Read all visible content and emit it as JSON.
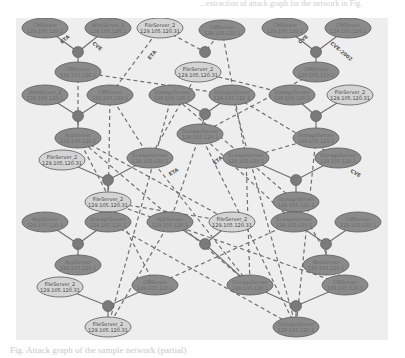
{
  "page": {
    "top_text": "...extraction of attack graph for the network in Fig.",
    "caption": "Fig. Attack graph of the sample network (partial)"
  },
  "colors": {
    "background": "#ffffff",
    "panel": "#eeeeee",
    "dark_node": "#8a8a8a",
    "light_node": "#d4d4d4",
    "junction": "#7a7a7a",
    "edge": "#707070"
  },
  "diagram": {
    "type": "attack-graph",
    "nodes": [
      {
        "id": "n1",
        "kind": "dark",
        "x": 45,
        "y": 28,
        "label": "CMServer",
        "sub": "129.105.120.1"
      },
      {
        "id": "n2",
        "kind": "dark",
        "x": 108,
        "y": 28,
        "label": "WebServer_2",
        "sub": "129.105.120.1"
      },
      {
        "id": "n3",
        "kind": "light",
        "x": 160,
        "y": 28,
        "label": "FileServer_2",
        "sub": "129.105.120.31"
      },
      {
        "id": "n4",
        "kind": "dark",
        "x": 222,
        "y": 30,
        "label": "CMServer",
        "sub": "129.105.120.1"
      },
      {
        "id": "n5",
        "kind": "dark",
        "x": 285,
        "y": 28,
        "label": "CMServer",
        "sub": "129.105.120.1"
      },
      {
        "id": "n6",
        "kind": "dark",
        "x": 348,
        "y": 28,
        "label": "CMServer",
        "sub": "129.105.120.1"
      },
      {
        "id": "n7",
        "kind": "dark",
        "x": 78,
        "y": 72,
        "label": "CMServer",
        "sub": "129.105.120.1"
      },
      {
        "id": "n8",
        "kind": "light",
        "x": 198,
        "y": 72,
        "label": "FileServer_2",
        "sub": "129.105.120.31"
      },
      {
        "id": "n9",
        "kind": "dark",
        "x": 316,
        "y": 72,
        "label": "CMServer",
        "sub": "129.105.120.1"
      },
      {
        "id": "n10",
        "kind": "dark",
        "x": 45,
        "y": 95,
        "label": "WebServer_2",
        "sub": "129.105.120.1"
      },
      {
        "id": "n11",
        "kind": "dark",
        "x": 110,
        "y": 95,
        "label": "CMServer",
        "sub": "129.105.120.1"
      },
      {
        "id": "n12",
        "kind": "dark",
        "x": 172,
        "y": 95,
        "label": "StorageServer",
        "sub": "129.105.120.1"
      },
      {
        "id": "n13",
        "kind": "dark",
        "x": 232,
        "y": 95,
        "label": "StorageServer",
        "sub": "129.105.120.1"
      },
      {
        "id": "n14",
        "kind": "dark",
        "x": 292,
        "y": 95,
        "label": "StorageServer",
        "sub": "129.105.120.1"
      },
      {
        "id": "n15",
        "kind": "light",
        "x": 350,
        "y": 95,
        "label": "FileServer_2",
        "sub": "129.105.120.31"
      },
      {
        "id": "n16",
        "kind": "dark",
        "x": 78,
        "y": 138,
        "label": "AppServer",
        "sub": "129.105.120.1"
      },
      {
        "id": "n17",
        "kind": "dark",
        "x": 200,
        "y": 134,
        "label": "StorageServer",
        "sub": "129.105.120.1"
      },
      {
        "id": "n18",
        "kind": "dark",
        "x": 316,
        "y": 138,
        "label": "StorageServer",
        "sub": "129.105.120.1"
      },
      {
        "id": "n19",
        "kind": "light",
        "x": 62,
        "y": 160,
        "label": "FileServer_2",
        "sub": "129.105.120.31"
      },
      {
        "id": "n20",
        "kind": "dark",
        "x": 150,
        "y": 158,
        "label": "StorageServer",
        "sub": "129.105.120.1"
      },
      {
        "id": "n21",
        "kind": "dark",
        "x": 246,
        "y": 158,
        "label": "StorageServer",
        "sub": "129.105.120.1"
      },
      {
        "id": "n22",
        "kind": "dark",
        "x": 338,
        "y": 158,
        "label": "StorageServer",
        "sub": "129.105.120.1"
      },
      {
        "id": "n23",
        "kind": "light",
        "x": 108,
        "y": 202,
        "label": "FileServer_2",
        "sub": "129.105.120.31"
      },
      {
        "id": "n24",
        "kind": "dark",
        "x": 296,
        "y": 202,
        "label": "StorageServer",
        "sub": "129.105.120.1"
      },
      {
        "id": "n25",
        "kind": "dark",
        "x": 45,
        "y": 222,
        "label": "AppServer",
        "sub": "129.105.120.1"
      },
      {
        "id": "n26",
        "kind": "dark",
        "x": 108,
        "y": 222,
        "label": "StorageServer",
        "sub": "129.105.120.1"
      },
      {
        "id": "n27",
        "kind": "dark",
        "x": 170,
        "y": 222,
        "label": "AppServer",
        "sub": "129.105.120.1"
      },
      {
        "id": "n28",
        "kind": "light",
        "x": 232,
        "y": 222,
        "label": "FileServer_2",
        "sub": "129.105.120.31"
      },
      {
        "id": "n29",
        "kind": "dark",
        "x": 294,
        "y": 222,
        "label": "StorageServer",
        "sub": "129.105.120.1"
      },
      {
        "id": "n30",
        "kind": "dark",
        "x": 358,
        "y": 222,
        "label": "CMServer",
        "sub": "129.105.120.1"
      },
      {
        "id": "n31",
        "kind": "dark",
        "x": 78,
        "y": 265,
        "label": "AppServer",
        "sub": "129.105.120.1"
      },
      {
        "id": "n32",
        "kind": "dark",
        "x": 326,
        "y": 265,
        "label": "WebServer",
        "sub": "129.105.120.1"
      },
      {
        "id": "n33",
        "kind": "light",
        "x": 60,
        "y": 287,
        "label": "FileServer_2",
        "sub": "129.105.120.31"
      },
      {
        "id": "n34",
        "kind": "dark",
        "x": 155,
        "y": 285,
        "label": "CMServer",
        "sub": "129.105.120.1"
      },
      {
        "id": "n35",
        "kind": "dark",
        "x": 250,
        "y": 285,
        "label": "StorageServer",
        "sub": "129.105.120.1"
      },
      {
        "id": "n36",
        "kind": "dark",
        "x": 345,
        "y": 285,
        "label": "CMServer",
        "sub": "129.105.120.1"
      },
      {
        "id": "n37",
        "kind": "light",
        "x": 108,
        "y": 327,
        "label": "FileServer_2",
        "sub": "129.105.120.31"
      },
      {
        "id": "n38",
        "kind": "dark",
        "x": 296,
        "y": 327,
        "label": "StorageServer",
        "sub": "129.105.120.1"
      }
    ],
    "junctions": [
      {
        "id": "j1",
        "x": 78,
        "y": 52
      },
      {
        "id": "j2",
        "x": 205,
        "y": 52
      },
      {
        "id": "j3",
        "x": 316,
        "y": 52
      },
      {
        "id": "j4",
        "x": 78,
        "y": 116
      },
      {
        "id": "j5",
        "x": 205,
        "y": 114
      },
      {
        "id": "j6",
        "x": 316,
        "y": 116
      },
      {
        "id": "j7",
        "x": 108,
        "y": 180
      },
      {
        "id": "j8",
        "x": 296,
        "y": 180
      },
      {
        "id": "j9",
        "x": 78,
        "y": 244
      },
      {
        "id": "j10",
        "x": 205,
        "y": 244
      },
      {
        "id": "j11",
        "x": 326,
        "y": 244
      },
      {
        "id": "j12",
        "x": 108,
        "y": 306
      },
      {
        "id": "j13",
        "x": 296,
        "y": 306
      }
    ],
    "edge_labels": [
      "ETA",
      "CVE",
      "ETA",
      "CVE",
      "CVE-2002",
      "ETA"
    ]
  }
}
